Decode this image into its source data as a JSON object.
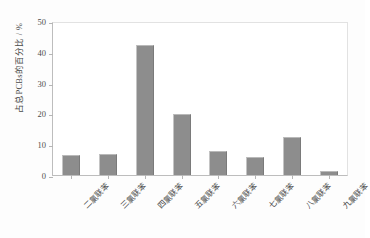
{
  "chart_data": {
    "type": "bar",
    "title": "",
    "subtitle": "",
    "xlabel": "",
    "ylabel": "占总PCBs的百分比 / %",
    "categories": [
      "二氯联苯",
      "三氯联苯",
      "四氯联苯",
      "五氯联苯",
      "六氯联苯",
      "七氯联苯",
      "八氯联苯",
      "九氯联苯"
    ],
    "values": [
      6.4,
      6.7,
      42.2,
      19.8,
      7.8,
      5.8,
      12.3,
      1.2
    ],
    "series": [
      {
        "name": "占总PCBs的百分比",
        "values": [
          6.4,
          6.7,
          42.2,
          19.8,
          7.8,
          5.8,
          12.3,
          1.2
        ]
      }
    ],
    "ylim": [
      0,
      50
    ],
    "yticks": [
      0,
      10,
      20,
      30,
      40,
      50
    ],
    "ytick_labels": [
      "0",
      "10",
      "20",
      "30",
      "40",
      "50"
    ],
    "grid": false,
    "legend": false,
    "legend_position": "none",
    "bar_color": "#8d8d8d",
    "axis_color": "#bdbdbd",
    "background_color": "#ffffff",
    "text_color": "#4a4a4a"
  }
}
